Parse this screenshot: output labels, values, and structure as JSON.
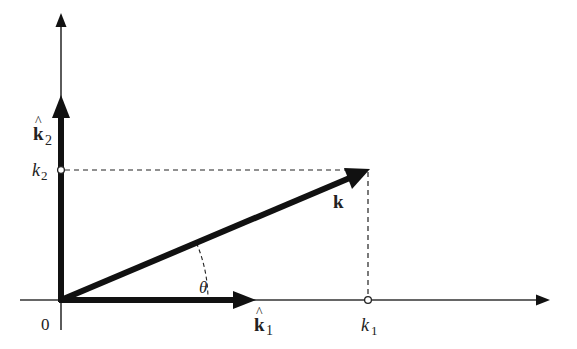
{
  "diagram": {
    "type": "vector-decomposition",
    "origin_label": "0",
    "axes": {
      "x": {
        "from": [
          20,
          300
        ],
        "to": [
          550,
          300
        ]
      },
      "y": {
        "from": [
          61,
          330
        ],
        "to": [
          61,
          13
        ]
      }
    },
    "origin": [
      61,
      300
    ],
    "unit_vectors": {
      "k1_hat": {
        "label": "k",
        "hat": "^",
        "subscript": "1",
        "tip": [
          256,
          300
        ]
      },
      "k2_hat": {
        "label": "k",
        "hat": "^",
        "subscript": "2",
        "tip": [
          61,
          95
        ]
      }
    },
    "vector_k": {
      "label": "k",
      "tip": [
        370,
        169
      ]
    },
    "components": {
      "k1": {
        "label": "k",
        "subscript": "1",
        "point": [
          368,
          300
        ]
      },
      "k2": {
        "label": "k",
        "subscript": "2",
        "point": [
          61,
          170
        ]
      }
    },
    "angle": {
      "label": "θ"
    },
    "colors": {
      "ink": "#111111",
      "axis": "#333333",
      "text": "#222222",
      "background": "#ffffff"
    }
  }
}
